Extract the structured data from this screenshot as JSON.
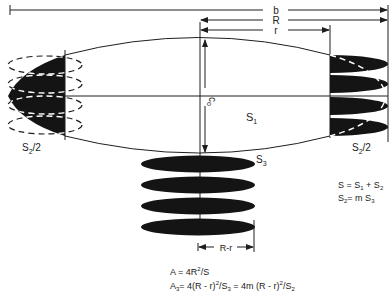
{
  "figure": {
    "dimensions": {
      "b_label": "b",
      "R_label": "R",
      "r_label": "r",
      "c0_label": "c",
      "c0_subscript": "o",
      "Rr_label": "R-r"
    },
    "regions": {
      "S1_label": "S",
      "S1_sub": "1",
      "S2_left_label": "S",
      "S2_left_sub": "2",
      "S2_left_suffix": "/2",
      "S2_right_label": "S",
      "S2_right_sub": "2",
      "S2_right_suffix": "/2",
      "S3_label": "S",
      "S3_sub": "3"
    },
    "equations_right": [
      {
        "text": "S = S",
        "sub1": "1",
        "mid": " + S",
        "sub2": "2"
      },
      {
        "text": "S",
        "sub1": "2",
        "mid": "= m S",
        "sub2": "3"
      }
    ],
    "equations_bottom": {
      "line1": {
        "lhs": "A",
        "rhs": " = 4R",
        "sup": "2",
        "tail": "/S"
      },
      "line2": {
        "lhs": "A",
        "lhs_sub": "3",
        "p1": "= 4(R - r)",
        "sup1": "2",
        "p2": "/S",
        "sub2": "3",
        "p3": " = 4m (R - r)",
        "sup3": "2",
        "p4": "/S",
        "sub4": "2"
      }
    },
    "colors": {
      "ink": "#141414",
      "background": "#ffffff"
    }
  }
}
